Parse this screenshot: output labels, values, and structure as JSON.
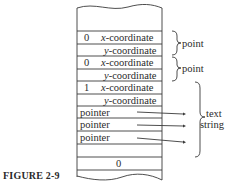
{
  "figure": {
    "caption": "FIGURE 2-9"
  },
  "memory_rows": [
    {
      "tag": "",
      "field": ""
    },
    {
      "tag": "",
      "field": ""
    },
    {
      "tag": "0",
      "field_prefix": "x",
      "field_suffix": "-coordinate"
    },
    {
      "tag": "",
      "field_prefix": "y",
      "field_suffix": "-coordinate"
    },
    {
      "tag": "0",
      "field_prefix": "x",
      "field_suffix": "-coordinate"
    },
    {
      "tag": "",
      "field_prefix": "y",
      "field_suffix": "-coordinate"
    },
    {
      "tag": "1",
      "field_prefix": "x",
      "field_suffix": "-coordinate"
    },
    {
      "tag": "",
      "field_prefix": "y",
      "field_suffix": "-coordinate"
    },
    {
      "label": "pointer"
    },
    {
      "label": "pointer"
    },
    {
      "label": "pointer"
    },
    {
      "label": ""
    },
    {
      "center": "0"
    }
  ],
  "annotations": {
    "point1": "point",
    "point2": "point",
    "text_line1": "text",
    "text_line2": "string"
  }
}
